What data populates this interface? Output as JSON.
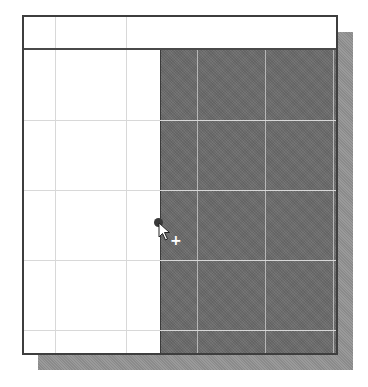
{
  "figure": {
    "colors": {
      "frame_border": "#3e3e3e",
      "selection_fill": "#6e6e6e",
      "shadow": "#9a9a9a",
      "grid_line": "#d8d8d8",
      "background": "#ffffff"
    },
    "grid": {
      "columns_x": [
        54,
        125,
        195,
        263,
        331
      ],
      "rows_y": [
        119,
        189,
        259,
        329
      ],
      "header_height": 33
    },
    "selection": {
      "left_x": 159,
      "top_y": 48,
      "right_x": 338,
      "bottom_y": 355
    },
    "cursor": {
      "icon": "arrow-pointer-icon",
      "modifier": "+",
      "anchor_dot": "drag-handle-dot",
      "position": [
        159,
        223
      ]
    }
  }
}
